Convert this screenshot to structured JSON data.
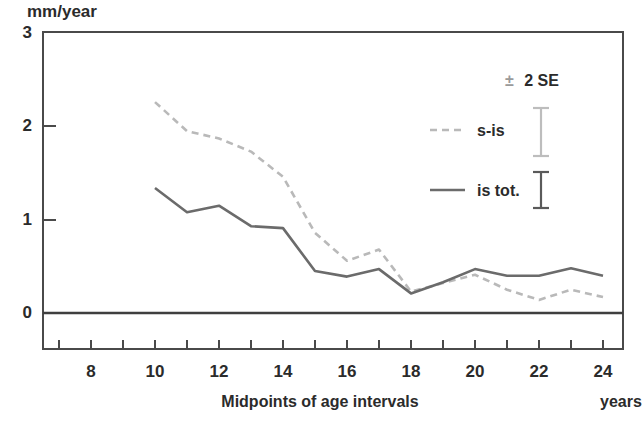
{
  "axes": {
    "y_unit_label": "mm/year",
    "y_ticks": [
      "0",
      "1",
      "2",
      "3"
    ],
    "x_title": "Midpoints of age intervals",
    "x_unit_label": "years",
    "x_ticks": [
      "8",
      "10",
      "12",
      "14",
      "16",
      "18",
      "20",
      "22",
      "24"
    ]
  },
  "legend": {
    "header_symbol": "±",
    "header_text": "2 SE",
    "item_dashed_label": "s-is",
    "item_solid_label": "is tot."
  },
  "colors": {
    "frame": "#4a4a4a",
    "solid_series": "#6b6b6b",
    "dashed_series": "#b9b9b9",
    "text": "#2b2b2b",
    "errorbar_light": "#bdbdbd",
    "errorbar_dark": "#5a5a5a"
  },
  "chart_data": {
    "type": "line",
    "title": "",
    "xlabel": "Midpoints of age intervals",
    "ylabel": "mm/year",
    "xlim": [
      6,
      25
    ],
    "ylim": [
      0,
      3
    ],
    "grid": false,
    "legend_position": "upper-right-inside",
    "x": [
      10,
      11,
      12,
      13,
      14,
      15,
      16,
      17,
      18,
      19,
      20,
      21,
      22,
      23,
      24
    ],
    "series": [
      {
        "name": "s-is",
        "style": "dashed",
        "color": "#b9b9b9",
        "values": [
          2.26,
          1.95,
          1.87,
          1.73,
          1.46,
          0.86,
          0.56,
          0.68,
          0.23,
          0.32,
          0.41,
          0.25,
          0.14,
          0.25,
          0.17
        ]
      },
      {
        "name": "is tot.",
        "style": "solid",
        "color": "#6b6b6b",
        "values": [
          1.34,
          1.08,
          1.15,
          0.93,
          0.91,
          0.45,
          0.39,
          0.47,
          0.21,
          0.33,
          0.47,
          0.4,
          0.4,
          0.48,
          0.4
        ]
      }
    ],
    "annotations": [
      "± 2 SE"
    ]
  }
}
